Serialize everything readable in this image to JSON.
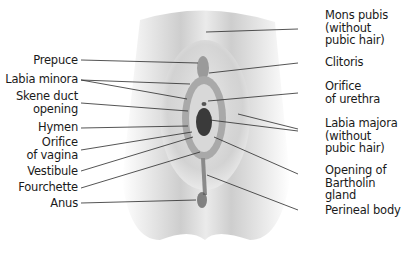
{
  "diagram": {
    "type": "labeled anatomical illustration",
    "style": "grayscale",
    "labels_left": [
      {
        "id": "prepuce",
        "text": "Prepuce"
      },
      {
        "id": "labia-minora",
        "text": "Labia minora"
      },
      {
        "id": "skene-duct-opening",
        "text": "Skene duct\nopening"
      },
      {
        "id": "hymen",
        "text": "Hymen"
      },
      {
        "id": "orifice-of-vagina",
        "text": "Orifice\nof vagina"
      },
      {
        "id": "vestibule",
        "text": "Vestibule"
      },
      {
        "id": "fourchette",
        "text": "Fourchette"
      },
      {
        "id": "anus",
        "text": "Anus"
      }
    ],
    "labels_right": [
      {
        "id": "mons-pubis",
        "text": "Mons pubis\n(without\npubic hair)"
      },
      {
        "id": "clitoris",
        "text": "Clitoris"
      },
      {
        "id": "orifice-of-urethra",
        "text": "Orifice\nof urethra"
      },
      {
        "id": "labia-majora",
        "text": "Labia majora\n(without\npubic hair)"
      },
      {
        "id": "opening-of-bartholin-gland",
        "text": "Opening of\nBartholin\ngland"
      },
      {
        "id": "perineal-body",
        "text": "Perineal body"
      }
    ],
    "colors": {
      "text": "#1a1a1a",
      "leader_line": "#2a2a2a",
      "background": "#ffffff"
    }
  }
}
